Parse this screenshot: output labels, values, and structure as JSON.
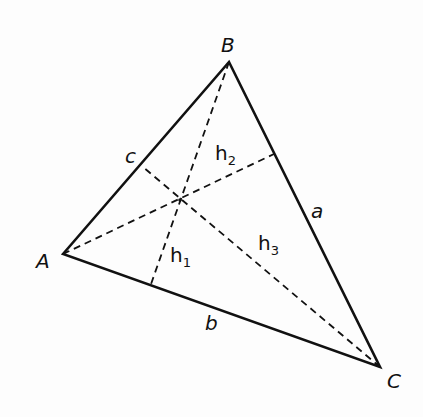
{
  "diagram": {
    "type": "triangle-altitudes",
    "vertices": {
      "A": {
        "label": "A",
        "x": 63,
        "y": 254
      },
      "B": {
        "label": "B",
        "x": 229,
        "y": 62
      },
      "C": {
        "label": "C",
        "x": 380,
        "y": 367
      }
    },
    "sides": {
      "a": {
        "label": "a",
        "between": "B-C"
      },
      "b": {
        "label": "b",
        "between": "A-C"
      },
      "c": {
        "label": "c",
        "between": "A-B"
      }
    },
    "altitudes": [
      {
        "label": "h",
        "sub": "1",
        "from": "B",
        "foot": {
          "x": 150,
          "y": 287
        }
      },
      {
        "label": "h",
        "sub": "2",
        "from": "A",
        "foot": {
          "x": 274,
          "y": 154
        }
      },
      {
        "label": "h",
        "sub": "3",
        "from": "C",
        "foot": {
          "x": 143,
          "y": 167
        }
      }
    ],
    "orthocenter": {
      "x": 180,
      "y": 200
    }
  }
}
